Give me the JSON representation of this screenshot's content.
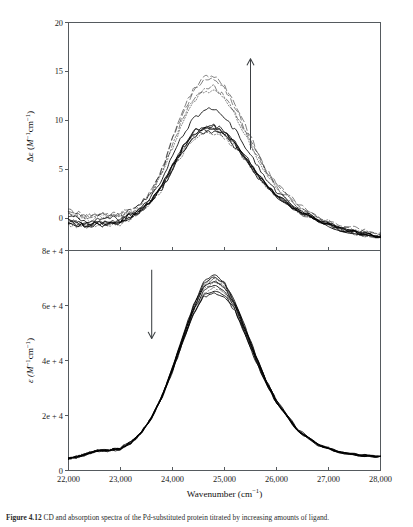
{
  "figure": {
    "caption_label": "Figure 4.12",
    "caption_text": "CD and absorption spectra of the Pd-substituted protein titrated by increasing amounts of ligand."
  },
  "axes": {
    "x": {
      "label": "Wavenumber (cm⁻¹)",
      "label_base": "Wavenumber (cm",
      "label_sup": "−1",
      "label_close": ")",
      "min": 22000,
      "max": 28000,
      "ticks": [
        22000,
        23000,
        24000,
        25000,
        26000,
        27000,
        28000
      ],
      "tick_labels": [
        "22,000",
        "23,000",
        "24,000",
        "25,000",
        "26,000",
        "27,000",
        "28,000"
      ]
    },
    "y_top": {
      "label": "Δε (M⁻¹cm⁻¹)",
      "label_delta": "Δε (",
      "label_m": "M",
      "label_sup1": "−1",
      "label_cm": "cm",
      "label_sup2": "−1",
      "label_close": ")",
      "min": -3.3,
      "max": 20,
      "ticks": [
        0,
        5,
        10,
        15,
        20
      ],
      "tick_labels": [
        "0",
        "5",
        "10",
        "15",
        "20"
      ]
    },
    "y_bottom": {
      "label": "ε (M⁻¹cm⁻¹)",
      "label_eps": "ε (",
      "label_m": "M",
      "label_sup1": "−1",
      "label_cm": "cm",
      "label_sup2": "−1",
      "label_close": ")",
      "min": 0,
      "max": 80000,
      "ticks": [
        0,
        20000,
        40000,
        60000,
        80000
      ],
      "tick_labels": [
        "0",
        "2e + 4",
        "4e + 4",
        "6e + 4",
        "8e + 4"
      ]
    }
  },
  "annotations": {
    "top_arrow": {
      "name": "increasing-arrow",
      "direction": "up",
      "x": 25500,
      "y_start": 7.0,
      "y_end": 16.3
    },
    "bottom_arrow": {
      "name": "decreasing-arrow",
      "direction": "down",
      "x": 23600,
      "y_start": 73000,
      "y_end": 48000
    }
  },
  "chart_data": [
    {
      "type": "line",
      "panel": "top",
      "title": "",
      "xlabel": "Wavenumber (cm⁻¹)",
      "ylabel": "Δε (M⁻¹cm⁻¹)",
      "xlim": [
        22000,
        28000
      ],
      "ylim": [
        -3.3,
        20
      ],
      "grid": false,
      "legend": "none",
      "x": [
        22000,
        22200,
        22400,
        22600,
        22800,
        23000,
        23200,
        23400,
        23600,
        23800,
        24000,
        24200,
        24400,
        24600,
        24800,
        25000,
        25200,
        25400,
        25600,
        25800,
        26000,
        26400,
        26800,
        27200,
        27600,
        28000
      ],
      "series": [
        {
          "name": "curve-01",
          "style": "dashed-long",
          "peak_x": 24800,
          "peak_y": 14.6,
          "values": [
            0.9,
            0.5,
            0.3,
            0.6,
            0.4,
            0.5,
            0.9,
            1.6,
            2.9,
            5.2,
            8.2,
            11.0,
            13.2,
            14.4,
            14.6,
            13.6,
            11.7,
            9.4,
            7.1,
            5.1,
            3.5,
            1.4,
            0.1,
            -0.7,
            -1.2,
            -1.5
          ]
        },
        {
          "name": "curve-02",
          "style": "dashed-long",
          "peak_x": 24800,
          "peak_y": 14.2,
          "values": [
            0.7,
            0.4,
            0.2,
            0.5,
            0.3,
            0.4,
            0.8,
            1.5,
            2.8,
            5.0,
            8.0,
            10.7,
            12.9,
            14.0,
            14.2,
            13.2,
            11.4,
            9.1,
            6.9,
            4.9,
            3.4,
            1.3,
            0.05,
            -0.8,
            -1.3,
            -1.6
          ]
        },
        {
          "name": "curve-03",
          "style": "dash-dot",
          "peak_x": 24800,
          "peak_y": 13.4,
          "values": [
            0.5,
            0.2,
            0.0,
            0.3,
            0.2,
            0.3,
            0.7,
            1.4,
            2.6,
            4.7,
            7.5,
            10.1,
            12.2,
            13.2,
            13.4,
            12.5,
            10.8,
            8.7,
            6.6,
            4.7,
            3.2,
            1.2,
            0.0,
            -0.9,
            -1.4,
            -1.7
          ]
        },
        {
          "name": "curve-04",
          "style": "dotted",
          "peak_x": 24800,
          "peak_y": 13.1,
          "values": [
            0.4,
            0.1,
            -0.1,
            0.2,
            0.1,
            0.25,
            0.65,
            1.35,
            2.5,
            4.6,
            7.3,
            9.9,
            11.9,
            12.9,
            13.1,
            12.2,
            10.5,
            8.5,
            6.4,
            4.6,
            3.1,
            1.15,
            -0.05,
            -0.95,
            -1.45,
            -1.75
          ]
        },
        {
          "name": "curve-05",
          "style": "solid",
          "peak_x": 24800,
          "peak_y": 11.2,
          "values": [
            0.2,
            -0.1,
            -0.3,
            0.0,
            -0.1,
            0.1,
            0.5,
            1.1,
            2.2,
            4.0,
            6.3,
            8.5,
            10.2,
            11.0,
            11.2,
            10.4,
            9.0,
            7.3,
            5.6,
            4.0,
            2.8,
            1.0,
            -0.1,
            -1.0,
            -1.5,
            -1.8
          ]
        },
        {
          "name": "curve-06",
          "style": "solid",
          "peak_x": 24800,
          "peak_y": 9.5,
          "values": [
            -0.2,
            -0.5,
            -0.6,
            -0.3,
            -0.4,
            -0.2,
            0.3,
            0.9,
            1.9,
            3.4,
            5.4,
            7.3,
            8.8,
            9.4,
            9.5,
            8.9,
            7.7,
            6.3,
            4.8,
            3.5,
            2.4,
            0.85,
            -0.2,
            -1.05,
            -1.6,
            -1.9
          ]
        },
        {
          "name": "curve-07",
          "style": "solid",
          "peak_x": 24800,
          "peak_y": 9.3,
          "values": [
            -0.35,
            -0.6,
            -0.7,
            -0.4,
            -0.5,
            -0.3,
            0.25,
            0.85,
            1.85,
            3.3,
            5.25,
            7.1,
            8.6,
            9.2,
            9.3,
            8.7,
            7.6,
            6.2,
            4.7,
            3.4,
            2.35,
            0.8,
            -0.25,
            -1.1,
            -1.62,
            -1.92
          ]
        },
        {
          "name": "curve-08",
          "style": "dashed-short",
          "peak_x": 24800,
          "peak_y": 9.1,
          "values": [
            -0.45,
            -0.7,
            -0.8,
            -0.5,
            -0.6,
            -0.4,
            0.2,
            0.8,
            1.8,
            3.2,
            5.1,
            7.0,
            8.4,
            9.0,
            9.1,
            8.6,
            7.5,
            6.1,
            4.65,
            3.35,
            2.3,
            0.78,
            -0.28,
            -1.12,
            -1.65,
            -1.95
          ]
        },
        {
          "name": "curve-09",
          "style": "solid",
          "peak_x": 24800,
          "peak_y": 8.9,
          "values": [
            -0.55,
            -0.8,
            -0.85,
            -0.6,
            -0.65,
            -0.45,
            0.15,
            0.75,
            1.75,
            3.1,
            5.0,
            6.85,
            8.25,
            8.8,
            8.9,
            8.4,
            7.35,
            6.0,
            4.6,
            3.3,
            2.25,
            0.75,
            -0.3,
            -1.15,
            -1.68,
            -1.98
          ]
        },
        {
          "name": "curve-10",
          "style": "dotted",
          "peak_x": 24800,
          "peak_y": 8.7,
          "values": [
            -0.6,
            -0.85,
            -0.9,
            -0.65,
            -0.7,
            -0.5,
            0.12,
            0.7,
            1.7,
            3.0,
            4.9,
            6.7,
            8.1,
            8.6,
            8.7,
            8.25,
            7.2,
            5.9,
            4.55,
            3.25,
            2.2,
            0.72,
            -0.32,
            -1.18,
            -1.7,
            -2.0
          ]
        },
        {
          "name": "curve-11",
          "style": "solid",
          "peak_x": 24800,
          "peak_y": 9.4,
          "values": [
            -0.3,
            -0.55,
            -0.65,
            -0.35,
            -0.45,
            -0.25,
            0.28,
            0.88,
            1.88,
            3.35,
            5.3,
            7.2,
            8.7,
            9.3,
            9.4,
            8.8,
            7.65,
            6.25,
            4.75,
            3.45,
            2.38,
            0.82,
            -0.22,
            -1.08,
            -1.6,
            -1.9
          ]
        },
        {
          "name": "curve-12",
          "style": "dash-dot",
          "peak_x": 24800,
          "peak_y": 9.0,
          "values": [
            -0.5,
            -0.75,
            -0.82,
            -0.55,
            -0.62,
            -0.42,
            0.18,
            0.78,
            1.78,
            3.15,
            5.05,
            6.9,
            8.35,
            8.9,
            9.0,
            8.5,
            7.45,
            6.05,
            4.62,
            3.32,
            2.28,
            0.76,
            -0.29,
            -1.14,
            -1.66,
            -1.96
          ]
        }
      ]
    },
    {
      "type": "line",
      "panel": "bottom",
      "title": "",
      "xlabel": "Wavenumber (cm⁻¹)",
      "ylabel": "ε (M⁻¹cm⁻¹)",
      "xlim": [
        22000,
        28000
      ],
      "ylim": [
        0,
        80000
      ],
      "grid": false,
      "legend": "none",
      "x": [
        22000,
        22200,
        22400,
        22600,
        22800,
        23000,
        23200,
        23400,
        23600,
        23800,
        24000,
        24200,
        24400,
        24600,
        24800,
        25000,
        25200,
        25400,
        25600,
        25800,
        26000,
        26400,
        26800,
        27200,
        27600,
        28000
      ],
      "series": [
        {
          "name": "abs-curve-01",
          "style": "solid",
          "peak_x": 24700,
          "peak_y": 71500,
          "values": [
            4500,
            5200,
            6600,
            7600,
            7500,
            8200,
            10500,
            14000,
            19500,
            27500,
            37500,
            49000,
            60000,
            68500,
            71500,
            68500,
            61500,
            52000,
            42000,
            33000,
            25500,
            15000,
            9500,
            6800,
            5500,
            5200
          ]
        },
        {
          "name": "abs-curve-02",
          "style": "solid",
          "peak_x": 24700,
          "peak_y": 70500,
          "values": [
            4450,
            5150,
            6500,
            7500,
            7400,
            8100,
            10400,
            13900,
            19400,
            27300,
            37200,
            48600,
            59400,
            67700,
            70500,
            67800,
            61000,
            51600,
            41700,
            32800,
            25300,
            14900,
            9450,
            6750,
            5480,
            5180
          ]
        },
        {
          "name": "abs-curve-03",
          "style": "dashed-short",
          "peak_x": 24700,
          "peak_y": 69500,
          "values": [
            4400,
            5100,
            6450,
            7450,
            7350,
            8050,
            10300,
            13800,
            19300,
            27100,
            36900,
            48200,
            58900,
            67000,
            69500,
            67000,
            60500,
            51200,
            41400,
            32600,
            25100,
            14800,
            9400,
            6720,
            5460,
            5160
          ]
        },
        {
          "name": "abs-curve-04",
          "style": "dotted",
          "peak_x": 24700,
          "peak_y": 68500,
          "values": [
            4380,
            5080,
            6400,
            7400,
            7300,
            8000,
            10250,
            13750,
            19250,
            27000,
            36700,
            47900,
            58500,
            66200,
            68500,
            66200,
            60000,
            50800,
            41100,
            32400,
            25000,
            14750,
            9380,
            6700,
            5450,
            5150
          ]
        },
        {
          "name": "abs-curve-05",
          "style": "solid",
          "peak_x": 24700,
          "peak_y": 67500,
          "values": [
            4350,
            5050,
            6350,
            7350,
            7250,
            7950,
            10200,
            13700,
            19200,
            26900,
            36500,
            47600,
            58000,
            65400,
            67500,
            65400,
            59500,
            50400,
            40800,
            32200,
            24900,
            14700,
            9350,
            6680,
            5440,
            5140
          ]
        },
        {
          "name": "abs-curve-06",
          "style": "dash-dot",
          "peak_x": 24700,
          "peak_y": 66500,
          "values": [
            4320,
            5020,
            6320,
            7320,
            7220,
            7920,
            10150,
            13650,
            19150,
            26800,
            36300,
            47300,
            57500,
            64600,
            66500,
            64600,
            59000,
            50000,
            40500,
            32000,
            24800,
            14650,
            9320,
            6660,
            5430,
            5130
          ]
        },
        {
          "name": "abs-curve-07",
          "style": "solid",
          "peak_x": 24700,
          "peak_y": 65500,
          "values": [
            4300,
            5000,
            6300,
            7300,
            7200,
            7900,
            10100,
            13600,
            19100,
            26700,
            36100,
            47000,
            57000,
            63800,
            65500,
            63800,
            58500,
            49600,
            40200,
            31800,
            24700,
            14600,
            9300,
            6640,
            5420,
            5120
          ]
        },
        {
          "name": "abs-curve-08",
          "style": "solid",
          "peak_x": 24700,
          "peak_y": 64500,
          "values": [
            4280,
            4980,
            6280,
            7280,
            7180,
            7880,
            10050,
            13550,
            19050,
            26600,
            35900,
            46700,
            56500,
            63000,
            64500,
            63000,
            58000,
            49200,
            39900,
            31600,
            24600,
            14550,
            9280,
            6620,
            5410,
            5110
          ]
        },
        {
          "name": "abs-curve-09",
          "style": "dotted",
          "peak_x": 24700,
          "peak_y": 70000,
          "values": [
            4420,
            5120,
            6480,
            7480,
            7380,
            8080,
            10350,
            13850,
            19350,
            27200,
            37000,
            48400,
            59200,
            67400,
            70000,
            67400,
            60800,
            51400,
            41550,
            32700,
            25200,
            14850,
            9420,
            6740,
            5470,
            5170
          ]
        },
        {
          "name": "abs-curve-10",
          "style": "solid",
          "peak_x": 24700,
          "peak_y": 69000,
          "values": [
            4390,
            5090,
            6430,
            7430,
            7330,
            8030,
            10280,
            13780,
            19280,
            27050,
            36800,
            48050,
            58700,
            66600,
            69000,
            66600,
            60250,
            51000,
            41250,
            32500,
            25050,
            14780,
            9390,
            6710,
            5455,
            5155
          ]
        }
      ]
    }
  ]
}
